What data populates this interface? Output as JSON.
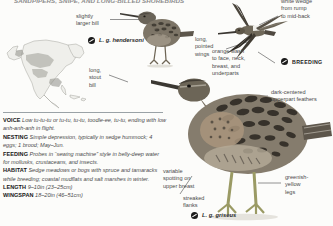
{
  "page": {
    "running_head": "SANDPIPERS, SNIPE, AND LONG-BILLED SHOREBIRDS",
    "background": "#fcfcfa",
    "ink": "#3a3a3a"
  },
  "map": {
    "name": "north-america-range-map",
    "land_color": "#efefeb",
    "border_color": "#9a9a94",
    "range_color": "#b4b4ae"
  },
  "textblock": {
    "entries": [
      {
        "key": "VOICE",
        "value": "Low tu-tu-tu or tu-tu, tu-tu, toodle-ee, tu-tu, ending with low anh-anh-anh in flight."
      },
      {
        "key": "NESTING",
        "value": "Simple depression, typically in sedge hummock; 4 eggs; 1 brood; May–Jun."
      },
      {
        "key": "FEEDING",
        "value": "Probes in “sewing machine” style in belly-deep water for mollusks, crustaceans, and insects."
      },
      {
        "key": "HABITAT",
        "value": "Sedge meadows or bogs with spruce and tamaracks while breeding; coastal mudflats and salt marshes in winter."
      },
      {
        "key": "LENGTH",
        "value": "9–10in (23–25cm)"
      },
      {
        "key": "WINGSPAN",
        "value": "18–20in (46–51cm)"
      }
    ]
  },
  "callouts": [
    {
      "name": "callout-slightly-larger-bill",
      "text": "slightly\nlarger bill"
    },
    {
      "name": "callout-long-stout-bill",
      "text": "long,\nstout\nbill"
    },
    {
      "name": "callout-long-pointed-wings",
      "text": "long,\npointed\nwings"
    },
    {
      "name": "callout-white-wedge-rump",
      "text": "white wedge\nfrom rump\nto mid-back"
    },
    {
      "name": "callout-orange-wash",
      "text": "orange wash\nto face, neck,\nbreast, and\nunderparts"
    },
    {
      "name": "callout-dark-centered-feathers",
      "text": "dark-centered\nupperpart feathers"
    },
    {
      "name": "callout-variable-spotting",
      "text": "variable\nspotting on\nupper breast"
    },
    {
      "name": "callout-streaked-flanks",
      "text": "streaked\nflanks"
    },
    {
      "name": "callout-greenish-yellow-legs",
      "text": "greenish-\nyellow\nlegs"
    }
  ],
  "subspecies": [
    {
      "name": "subspecies-hendersoni",
      "label": "L. g. hendersoni"
    },
    {
      "name": "subspecies-griseus",
      "label": "L. g. griseus"
    }
  ],
  "plumage_badge": {
    "name": "breeding-badge",
    "label": "BREEDING"
  }
}
